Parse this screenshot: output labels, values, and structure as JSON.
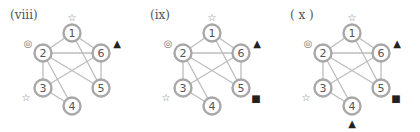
{
  "diagrams": [
    {
      "label": "(viii)",
      "nodes": [
        "1",
        "2",
        "3",
        "4",
        "5",
        "6"
      ],
      "edges": [
        [
          "1",
          "2"
        ],
        [
          "1",
          "6"
        ],
        [
          "1",
          "5"
        ],
        [
          "2",
          "6"
        ],
        [
          "2",
          "5"
        ],
        [
          "2",
          "4"
        ],
        [
          "2",
          "3"
        ],
        [
          "3",
          "6"
        ],
        [
          "3",
          "4"
        ],
        [
          "6",
          "5"
        ]
      ],
      "markers": [
        {
          "node": "1",
          "symbol": "☆",
          "type": "star-outline"
        },
        {
          "node": "2",
          "symbol": "◎",
          "type": "double-circle"
        },
        {
          "node": "3",
          "symbol": "☆",
          "type": "star-outline"
        },
        {
          "node": "6",
          "symbol": "▲",
          "type": "filled-triangle"
        }
      ]
    },
    {
      "label": "(ix)",
      "nodes": [
        "1",
        "2",
        "3",
        "4",
        "5",
        "6"
      ],
      "edges": [
        [
          "1",
          "2"
        ],
        [
          "1",
          "6"
        ],
        [
          "1",
          "5"
        ],
        [
          "2",
          "6"
        ],
        [
          "2",
          "5"
        ],
        [
          "2",
          "4"
        ],
        [
          "2",
          "3"
        ],
        [
          "3",
          "6"
        ],
        [
          "3",
          "4"
        ],
        [
          "6",
          "5"
        ]
      ],
      "markers": [
        {
          "node": "1",
          "symbol": "☆",
          "type": "star-outline"
        },
        {
          "node": "2",
          "symbol": "◎",
          "type": "double-circle"
        },
        {
          "node": "3",
          "symbol": "☆",
          "type": "star-outline"
        },
        {
          "node": "6",
          "symbol": "▲",
          "type": "filled-triangle"
        },
        {
          "node": "5",
          "symbol": "■",
          "type": "filled-square"
        }
      ]
    },
    {
      "label": "( x )",
      "nodes": [
        "1",
        "2",
        "3",
        "4",
        "5",
        "6"
      ],
      "edges": [
        [
          "1",
          "2"
        ],
        [
          "1",
          "6"
        ],
        [
          "1",
          "5"
        ],
        [
          "2",
          "6"
        ],
        [
          "2",
          "5"
        ],
        [
          "2",
          "4"
        ],
        [
          "2",
          "3"
        ],
        [
          "3",
          "6"
        ],
        [
          "3",
          "4"
        ],
        [
          "6",
          "5"
        ]
      ],
      "markers": [
        {
          "node": "1",
          "symbol": "☆",
          "type": "star-outline"
        },
        {
          "node": "2",
          "symbol": "◎",
          "type": "double-circle"
        },
        {
          "node": "3",
          "symbol": "☆",
          "type": "star-outline"
        },
        {
          "node": "6",
          "symbol": "▲",
          "type": "filled-triangle"
        },
        {
          "node": "5",
          "symbol": "■",
          "type": "filled-square"
        },
        {
          "node": "4",
          "symbol": "▲",
          "type": "filled-triangle"
        }
      ]
    }
  ],
  "colors": {
    "edge": "#bdbdbd",
    "node_stroke": "#a8a8a8",
    "node_text": "#555555",
    "marker": "#222222",
    "marker_light": "#777777"
  }
}
